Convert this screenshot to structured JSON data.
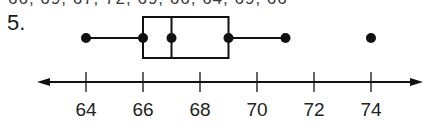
{
  "header": {
    "cropped_text": "66, 69, 67, 72, 69, 66, 64, 69, 66",
    "problem_number": "5."
  },
  "chart_data": {
    "type": "boxplot",
    "title": "",
    "xlabel": "",
    "ylabel": "",
    "axis": {
      "ticks": [
        64,
        66,
        68,
        70,
        72,
        74
      ],
      "tick_labels": [
        "64",
        "66",
        "68",
        "70",
        "72",
        "74"
      ],
      "range": [
        63.2,
        75.8
      ],
      "arrows": "both"
    },
    "min": 64,
    "q1": 66,
    "median": 67,
    "q3": 69,
    "whisker_max": 71,
    "outliers": [
      74
    ],
    "grid": false
  },
  "colors": {
    "ink": "#111111",
    "background": "#ffffff"
  }
}
